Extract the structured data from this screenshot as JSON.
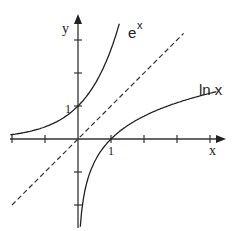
{
  "diagram": {
    "axes": {
      "x_label": "x",
      "y_label": "y",
      "origin_px": [
        78,
        139
      ],
      "unit_px": 33,
      "x_range": [
        -2,
        4.4
      ],
      "y_range": [
        -2.8,
        3.8
      ],
      "x_ticks": [
        -2,
        -1,
        1,
        2,
        3,
        4
      ],
      "y_ticks": [
        -2,
        -1,
        1,
        2,
        3
      ]
    },
    "tick_labels": {
      "x_one": "1",
      "y_one": "1"
    },
    "curves": [
      {
        "name": "exp",
        "label": "e",
        "label_sup": "x",
        "style": "solid"
      },
      {
        "name": "log",
        "label": "ln x",
        "style": "solid"
      },
      {
        "name": "identity",
        "label": "y = x",
        "style": "dashed"
      }
    ],
    "colors": {
      "ink": "#222222",
      "background": "#ffffff"
    }
  }
}
